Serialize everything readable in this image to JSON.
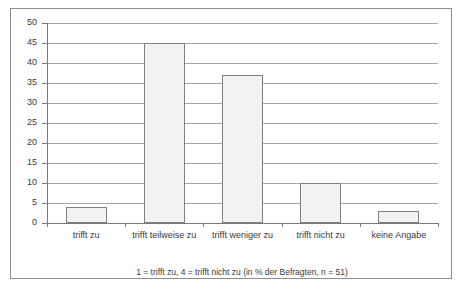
{
  "chart_data": {
    "type": "bar",
    "title": "",
    "subtitle": "",
    "xlabel": "",
    "ylabel": "",
    "categories": [
      "trifft zu",
      "trifft teilweise zu",
      "trifft weniger zu",
      "trifft nicht zu",
      "keine Angabe"
    ],
    "values": [
      4,
      45,
      37,
      10,
      3
    ],
    "ylim": [
      0,
      50
    ],
    "ytick_step": 5,
    "yticks": [
      0,
      5,
      10,
      15,
      20,
      25,
      30,
      35,
      40,
      45,
      50
    ],
    "ytick_labels": [
      "0",
      "5",
      "10",
      "15",
      "20",
      "25",
      "30",
      "35",
      "40",
      "45",
      "50"
    ],
    "grid": true,
    "grid_axis": "y",
    "legend": false,
    "legend_position": "none",
    "annotation": "1 = trifft zu, 4 = trifft nicht zu (in % der Befragten, n = 51)",
    "bar_fill_color": "#f2f2f2",
    "bar_border_color": "#808080",
    "gridline_color": "#a6a6a6",
    "axis_color": "#7a7a7a",
    "frame_color": "#8d8d8d",
    "text_color": "#3a3a3a",
    "background_color": "#ffffff"
  },
  "footnote": {
    "text": "1 = trifft zu, 4 = trifft nicht zu (in % der Befragten, n = 51)"
  }
}
